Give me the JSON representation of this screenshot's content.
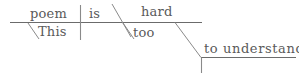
{
  "diagram": {
    "type": "reed-kellogg-sentence-diagram",
    "sentence": "This poem is too hard to understand.",
    "ink_color": "#5a5a5a",
    "background_color": "#ffffff",
    "words": {
      "subject": "poem",
      "subject_modifier": "This",
      "verb": "is",
      "predicate_adjective": "hard",
      "adverb": "too",
      "infinitive_phrase": "to understand"
    },
    "lines": {
      "baseline_label": "main-baseline",
      "subject_verb_divider_label": "subject-verb-divider",
      "complement_slant_label": "predicate-complement-slant",
      "this_slant_label": "this-modifier-slant",
      "too_slant_label": "too-modifier-slant",
      "infinitive_slant_label": "infinitive-connector-slant",
      "infinitive_baseline_label": "infinitive-baseline",
      "infinitive_stem_label": "infinitive-stem"
    }
  }
}
